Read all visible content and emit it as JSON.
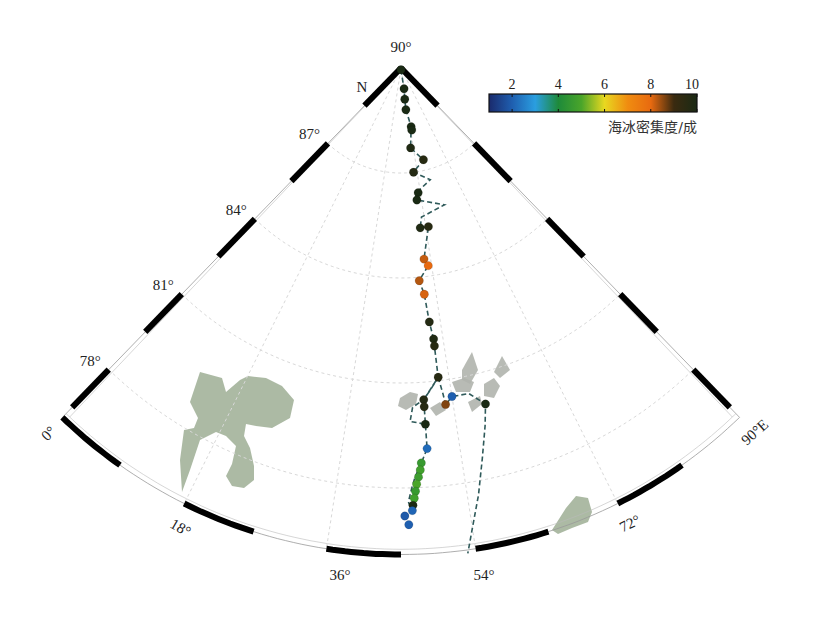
{
  "chart_data": {
    "type": "scatter",
    "title": "",
    "projection": "north-polar-stereographic-sector",
    "pole_label": "90°",
    "north_label": "N",
    "lon_range": [
      0,
      90
    ],
    "lat_range": [
      76.1,
      90
    ],
    "lat_ticks": [
      {
        "lat": 87,
        "label": "87°"
      },
      {
        "lat": 84,
        "label": "84°"
      },
      {
        "lat": 81,
        "label": "81°"
      },
      {
        "lat": 78,
        "label": "78°"
      }
    ],
    "lon_ticks": [
      {
        "lon": 0,
        "label": "0°"
      },
      {
        "lon": 18,
        "label": "18°"
      },
      {
        "lon": 36,
        "label": "36°"
      },
      {
        "lon": 54,
        "label": "54°"
      },
      {
        "lon": 72,
        "label": "72°"
      },
      {
        "lon": 90,
        "label": "90°E"
      }
    ],
    "grid": true,
    "colorbar": {
      "label": "海冰密集度/成",
      "ticks": [
        2,
        4,
        6,
        8,
        10
      ],
      "range": [
        1,
        10
      ],
      "position": "top-right",
      "colors": [
        "#1a2a6c",
        "#1f5fb0",
        "#2a9ee0",
        "#1e8a3a",
        "#4aa52a",
        "#e8d820",
        "#f08c10",
        "#e86a10",
        "#3a2a10",
        "#1a2a14"
      ]
    },
    "track_series": [
      {
        "name": "ship-track-outbound",
        "style": "dashed",
        "color": "#2f5a5a",
        "points": [
          [
            45,
            89.95
          ],
          [
            53.5,
            89.4
          ],
          [
            52,
            89.1
          ],
          [
            51.8,
            88.8
          ],
          [
            55,
            88.3
          ],
          [
            52,
            87.7
          ],
          [
            59,
            87.3
          ],
          [
            52,
            87.0
          ],
          [
            60,
            86.7
          ],
          [
            52,
            86.4
          ],
          [
            52,
            86.2
          ],
          [
            63,
            85.9
          ],
          [
            53,
            85.7
          ],
          [
            52,
            85.4
          ],
          [
            55,
            85.4
          ],
          [
            52,
            84.5
          ],
          [
            53,
            84.3
          ],
          [
            50,
            83.9
          ],
          [
            51,
            83.5
          ],
          [
            51.5,
            82.7
          ],
          [
            52,
            82.2
          ],
          [
            52,
            82.0
          ],
          [
            52,
            81.1
          ],
          [
            49,
            80.5
          ],
          [
            49,
            80.3
          ],
          [
            49,
            79.8
          ],
          [
            49,
            79.1
          ],
          [
            48,
            78.7
          ],
          [
            47,
            78.3
          ],
          [
            46.5,
            78.0
          ],
          [
            46,
            77.6
          ],
          [
            46.5,
            77.3
          ]
        ]
      },
      {
        "name": "ship-track-return",
        "style": "dashed",
        "color": "#2f5a5a",
        "points": [
          [
            52,
            81.1
          ],
          [
            52.5,
            80.6
          ],
          [
            52.7,
            80.3
          ],
          [
            54,
            80.5
          ],
          [
            57,
            80.5
          ],
          [
            59.4,
            80.1
          ],
          [
            58.5,
            79.5
          ],
          [
            57,
            78.6
          ],
          [
            55.5,
            77.6
          ],
          [
            54,
            76.7
          ],
          [
            53,
            76.0
          ]
        ]
      },
      {
        "name": "ship-track-loop",
        "style": "dashed",
        "color": "#2f5a5a",
        "points": [
          [
            52,
            81.1
          ],
          [
            50.5,
            80.8
          ],
          [
            49,
            80.5
          ],
          [
            47,
            80.3
          ],
          [
            46.5,
            79.9
          ],
          [
            49,
            79.8
          ]
        ]
      }
    ],
    "points": [
      {
        "lon": 45,
        "lat": 89.95,
        "value": 10
      },
      {
        "lon": 53.5,
        "lat": 89.4,
        "value": 10
      },
      {
        "lon": 52,
        "lat": 89.1,
        "value": 10
      },
      {
        "lon": 51.8,
        "lat": 88.8,
        "value": 10
      },
      {
        "lon": 55,
        "lat": 88.3,
        "value": 10
      },
      {
        "lon": 55,
        "lat": 88.2,
        "value": 10
      },
      {
        "lon": 52,
        "lat": 87.7,
        "value": 9.8
      },
      {
        "lon": 59,
        "lat": 87.3,
        "value": 9.6
      },
      {
        "lon": 52,
        "lat": 87.0,
        "value": 9.7
      },
      {
        "lon": 53,
        "lat": 86.4,
        "value": 10
      },
      {
        "lon": 52,
        "lat": 86.2,
        "value": 10
      },
      {
        "lon": 52,
        "lat": 85.4,
        "value": 9.8
      },
      {
        "lon": 55,
        "lat": 85.4,
        "value": 9.6
      },
      {
        "lon": 52,
        "lat": 84.5,
        "value": 8.2
      },
      {
        "lon": 53,
        "lat": 84.3,
        "value": 8.0
      },
      {
        "lon": 50,
        "lat": 83.9,
        "value": 8.3
      },
      {
        "lon": 51,
        "lat": 83.5,
        "value": 8.1
      },
      {
        "lon": 51.5,
        "lat": 82.7,
        "value": 9.7
      },
      {
        "lon": 52,
        "lat": 82.2,
        "value": 9.8
      },
      {
        "lon": 52,
        "lat": 82.0,
        "value": 9.6
      },
      {
        "lon": 52,
        "lat": 81.1,
        "value": 9.6
      },
      {
        "lon": 49,
        "lat": 80.5,
        "value": 9.7
      },
      {
        "lon": 49,
        "lat": 80.3,
        "value": 9.6
      },
      {
        "lon": 54,
        "lat": 80.5,
        "value": 2
      },
      {
        "lon": 52.7,
        "lat": 80.3,
        "value": 8.6
      },
      {
        "lon": 59.4,
        "lat": 80.1,
        "value": 10
      },
      {
        "lon": 49,
        "lat": 79.8,
        "value": 10
      },
      {
        "lon": 49,
        "lat": 79.1,
        "value": 2.2
      },
      {
        "lon": 48,
        "lat": 78.7,
        "value": 4.6
      },
      {
        "lon": 47.8,
        "lat": 78.5,
        "value": 4.8
      },
      {
        "lon": 47.5,
        "lat": 78.3,
        "value": 4.7
      },
      {
        "lon": 47.2,
        "lat": 78.1,
        "value": 5.0
      },
      {
        "lon": 47,
        "lat": 77.9,
        "value": 4.6
      },
      {
        "lon": 46.8,
        "lat": 77.7,
        "value": 4.8
      },
      {
        "lon": 46.6,
        "lat": 77.5,
        "value": 9.9
      },
      {
        "lon": 46.5,
        "lat": 77.35,
        "value": 2.1
      },
      {
        "lon": 45.5,
        "lat": 77.2,
        "value": 1.9
      },
      {
        "lon": 46,
        "lat": 76.95,
        "value": 2.0
      }
    ],
    "land_polygons": [
      {
        "name": "svalbard",
        "color": "#a3b39a",
        "px": [
          [
            200,
            372
          ],
          [
            222,
            378
          ],
          [
            226,
            392
          ],
          [
            240,
            380
          ],
          [
            248,
            376
          ],
          [
            266,
            378
          ],
          [
            282,
            386
          ],
          [
            294,
            400
          ],
          [
            290,
            418
          ],
          [
            272,
            428
          ],
          [
            256,
            426
          ],
          [
            246,
            424
          ],
          [
            244,
            436
          ],
          [
            250,
            448
          ],
          [
            254,
            466
          ],
          [
            254,
            480
          ],
          [
            244,
            488
          ],
          [
            232,
            486
          ],
          [
            226,
            476
          ],
          [
            232,
            464
          ],
          [
            236,
            446
          ],
          [
            226,
            436
          ],
          [
            216,
            432
          ],
          [
            200,
            440
          ],
          [
            190,
            470
          ],
          [
            182,
            492
          ],
          [
            180,
            460
          ],
          [
            184,
            430
          ],
          [
            194,
            428
          ],
          [
            198,
            418
          ],
          [
            190,
            402
          ]
        ]
      },
      {
        "name": "franz-josef-land-1",
        "color": "#b0b4ad",
        "px": [
          [
            400,
            398
          ],
          [
            410,
            392
          ],
          [
            418,
            394
          ],
          [
            416,
            404
          ],
          [
            406,
            410
          ],
          [
            398,
            406
          ]
        ]
      },
      {
        "name": "franz-josef-land-2",
        "color": "#b0b4ad",
        "px": [
          [
            462,
            370
          ],
          [
            472,
            352
          ],
          [
            478,
            370
          ],
          [
            470,
            384
          ],
          [
            462,
            380
          ]
        ]
      },
      {
        "name": "franz-josef-land-3",
        "color": "#b0b4ad",
        "px": [
          [
            452,
            382
          ],
          [
            464,
            378
          ],
          [
            474,
            382
          ],
          [
            470,
            392
          ],
          [
            456,
            392
          ]
        ]
      },
      {
        "name": "franz-josef-land-4",
        "color": "#b0b4ad",
        "px": [
          [
            494,
            372
          ],
          [
            502,
            356
          ],
          [
            510,
            370
          ],
          [
            500,
            378
          ]
        ]
      },
      {
        "name": "franz-josef-land-5",
        "color": "#b0b4ad",
        "px": [
          [
            484,
            384
          ],
          [
            494,
            378
          ],
          [
            500,
            386
          ],
          [
            494,
            398
          ],
          [
            484,
            396
          ]
        ]
      },
      {
        "name": "franz-josef-land-6",
        "color": "#b0b4ad",
        "px": [
          [
            468,
            402
          ],
          [
            480,
            396
          ],
          [
            482,
            404
          ],
          [
            472,
            412
          ]
        ]
      },
      {
        "name": "franz-josef-land-7",
        "color": "#b0b4ad",
        "px": [
          [
            430,
            408
          ],
          [
            440,
            402
          ],
          [
            446,
            410
          ],
          [
            436,
            416
          ]
        ]
      },
      {
        "name": "novaya-zemlya-tip",
        "color": "#a3b39a",
        "px": [
          [
            552,
            530
          ],
          [
            566,
            508
          ],
          [
            576,
            496
          ],
          [
            588,
            498
          ],
          [
            592,
            512
          ],
          [
            588,
            522
          ],
          [
            572,
            528
          ],
          [
            558,
            534
          ]
        ]
      }
    ]
  },
  "geometry": {
    "center": [
      401,
      68
    ],
    "px_per_degree_lat": 35,
    "outer_lat": 76.1
  }
}
